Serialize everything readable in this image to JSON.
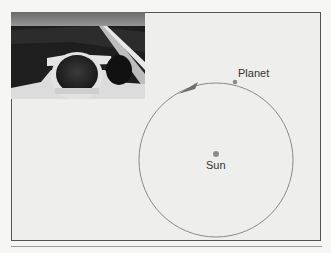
{
  "figure": {
    "photo_alt": "Race car cockpit view with driver helmet on track",
    "labels": {
      "planet": "Planet",
      "sun": "Sun"
    },
    "colors": {
      "orbit": "#8a8a8a",
      "dot": "#8c8c8c",
      "arrow": "#6e6e6e",
      "frame": "#555555",
      "background": "#eeeeec"
    }
  }
}
